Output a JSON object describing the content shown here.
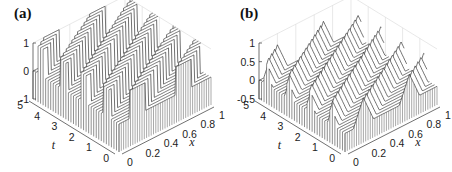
{
  "figure": {
    "panels": [
      {
        "id": "a",
        "label": "(a)"
      },
      {
        "id": "b",
        "label": "(b)"
      }
    ]
  },
  "chart_data": [
    {
      "type": "waterfall3d",
      "panel_label": "(a)",
      "xlabel": "x",
      "ylabel": "t",
      "zlabel": "",
      "x_ticks": [
        "0",
        "0.2",
        "0.4",
        "0.6",
        "0.8",
        "1"
      ],
      "t_ticks": [
        "0",
        "1",
        "2",
        "3",
        "4",
        "5"
      ],
      "z_ticks": [
        "-1",
        "0",
        "1"
      ],
      "xlim": [
        0,
        1
      ],
      "tlim": [
        0,
        5
      ],
      "zlim": [
        -1,
        1
      ],
      "grid": true,
      "description": "Piecewise-constant square-wave profile u(x,t) with values roughly in {0, 1}, travelling diagonally (periodic transport); plotted as waterfall curves along x for successive t.",
      "profile": "square",
      "amplitude": 1,
      "speed": 0.4,
      "period": 1,
      "pulse_widths": [
        0.18,
        0.18
      ],
      "pulse_centers": [
        0.2,
        0.7
      ],
      "n_curves": 34
    },
    {
      "type": "waterfall3d",
      "panel_label": "(b)",
      "xlabel": "x",
      "ylabel": "t",
      "zlabel": "",
      "x_ticks": [
        "0",
        "0.2",
        "0.4",
        "0.6",
        "0.8",
        "1"
      ],
      "t_ticks": [
        "0",
        "1",
        "2",
        "3",
        "4",
        "5"
      ],
      "z_ticks": [
        "-0.5",
        "0",
        "0.5",
        "1"
      ],
      "xlim": [
        0,
        1
      ],
      "tlim": [
        0,
        5
      ],
      "zlim": [
        -0.5,
        1
      ],
      "grid": true,
      "description": "Triangular (tent) wave profiles with peak ~0.7 travelling diagonally in the same periodic transport pattern; plotted as waterfall curves along x for successive t.",
      "profile": "triangle",
      "amplitude": 0.7,
      "speed": 0.4,
      "period": 1,
      "pulse_widths": [
        0.22,
        0.22
      ],
      "pulse_centers": [
        0.2,
        0.7
      ],
      "n_curves": 34
    }
  ]
}
